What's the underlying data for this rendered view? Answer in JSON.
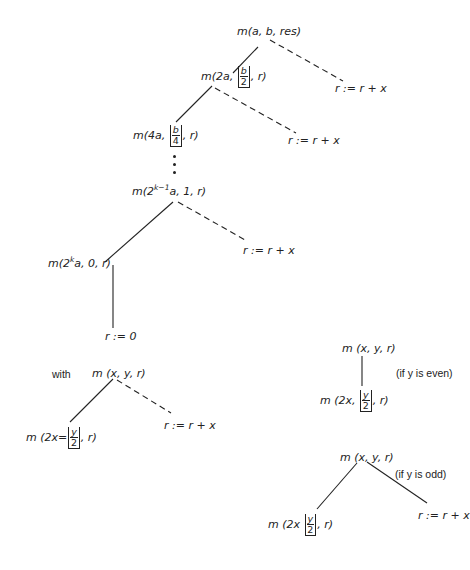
{
  "diagram": {
    "type": "recursion-tree",
    "main_tree": {
      "root": {
        "label": "m(a, b, res)"
      },
      "level1": {
        "label_prefix": "m(2a, ",
        "frac_num": "b",
        "frac_den": "2",
        "label_suffix": ", r)"
      },
      "level2": {
        "label_prefix": "m(4a, ",
        "frac_num": "b",
        "frac_den": "4",
        "label_suffix": ", r)"
      },
      "level_k_minus_1": {
        "label_prefix": "m(2",
        "exponent": "k−1",
        "label_suffix": "a, 1, r)"
      },
      "level_k": {
        "label_prefix": "m(2",
        "exponent": "k",
        "label_suffix": "a, 0, r)"
      },
      "leaf": {
        "label": "r := 0"
      },
      "dashed_leaves": [
        "r := r + x",
        "r := r + x",
        "r := r + x"
      ],
      "ellipsis": "⋮"
    },
    "with_rule": {
      "keyword": "with",
      "root": "m (x, y, r)",
      "child_prefix": "m (2x=",
      "child_frac_num": "y",
      "child_frac_den": "2",
      "child_suffix": ", r)",
      "dashed_leaf": "r := r + x"
    },
    "even_rule": {
      "root": "m (x, y, r)",
      "condition": "(if y is even)",
      "child_prefix": "m (2x, ",
      "child_frac_num": "y",
      "child_frac_den": "2",
      "child_suffix": ", r)"
    },
    "odd_rule": {
      "root": "m (x, y, r)",
      "condition": "(if y is odd)",
      "child_prefix": "m (2x ",
      "child_frac_num": "y",
      "child_frac_den": "2",
      "child_suffix": ", r)",
      "leaf": "r := r + x"
    },
    "edge_legend": {
      "solid": "recursive call",
      "dashed": "accumulate r := r + x"
    },
    "colors": {
      "ink": "#222222",
      "background": "#ffffff"
    }
  }
}
